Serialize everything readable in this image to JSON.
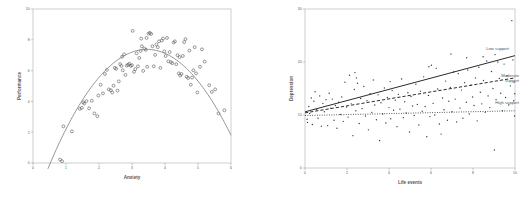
{
  "figure": {
    "panels": [
      "anxiety-performance",
      "life-events-depression"
    ]
  },
  "chart_data": [
    {
      "id": "anxiety-performance",
      "type": "scatter",
      "title": "",
      "xlabel": "Anxiety",
      "ylabel": "Performance",
      "xlim": [
        0,
        6
      ],
      "ylim": [
        0,
        10
      ],
      "xticks": [
        0,
        1,
        2,
        3,
        4,
        5,
        6
      ],
      "xtick_labels": [
        "0",
        "1",
        "2",
        "3",
        "4",
        "5",
        "6"
      ],
      "yticks": [
        0,
        2,
        4,
        6,
        8,
        10
      ],
      "ytick_labels": [
        "0",
        "2",
        "4",
        "6",
        "8",
        "10"
      ],
      "grid": false,
      "legend": "none",
      "marker": "open-circle",
      "fit": {
        "kind": "quadratic",
        "label": "quadratic fit curve",
        "style": "solid",
        "color": "#8a8a90",
        "peak_x": 3.45,
        "peak_y": 7.35,
        "coefficients": {
          "a": -0.86,
          "b": 5.94,
          "c": -2.88
        }
      },
      "points": [
        [
          0.82,
          0.22
        ],
        [
          0.88,
          0.12
        ],
        [
          0.92,
          2.38
        ],
        [
          1.18,
          2.05
        ],
        [
          1.42,
          3.52
        ],
        [
          1.48,
          3.58
        ],
        [
          1.52,
          3.95
        ],
        [
          1.55,
          3.86
        ],
        [
          1.62,
          4.02
        ],
        [
          1.7,
          3.55
        ],
        [
          1.78,
          4.04
        ],
        [
          1.86,
          3.22
        ],
        [
          1.95,
          3.04
        ],
        [
          1.98,
          4.38
        ],
        [
          2.05,
          5.08
        ],
        [
          2.12,
          4.52
        ],
        [
          2.18,
          5.78
        ],
        [
          2.24,
          6.05
        ],
        [
          2.3,
          4.78
        ],
        [
          2.36,
          4.72
        ],
        [
          2.4,
          4.58
        ],
        [
          2.44,
          5.02
        ],
        [
          2.48,
          6.18
        ],
        [
          2.52,
          6.12
        ],
        [
          2.56,
          4.7
        ],
        [
          2.6,
          5.3
        ],
        [
          2.64,
          6.42
        ],
        [
          2.68,
          6.3
        ],
        [
          2.72,
          6.02
        ],
        [
          2.76,
          7.05
        ],
        [
          2.8,
          5.72
        ],
        [
          2.84,
          6.32
        ],
        [
          2.88,
          6.38
        ],
        [
          2.92,
          6.45
        ],
        [
          2.96,
          6.3
        ],
        [
          3.0,
          6.35
        ],
        [
          3.02,
          8.58
        ],
        [
          3.06,
          5.92
        ],
        [
          3.1,
          6.1
        ],
        [
          3.14,
          7.12
        ],
        [
          3.18,
          6.28
        ],
        [
          3.22,
          6.82
        ],
        [
          3.26,
          7.28
        ],
        [
          3.3,
          7.58
        ],
        [
          3.34,
          5.98
        ],
        [
          3.38,
          7.42
        ],
        [
          3.42,
          7.35
        ],
        [
          3.46,
          6.25
        ],
        [
          3.5,
          8.4
        ],
        [
          3.54,
          8.45
        ],
        [
          3.58,
          8.38
        ],
        [
          3.62,
          7.58
        ],
        [
          3.66,
          6.28
        ],
        [
          3.7,
          7.02
        ],
        [
          3.74,
          7.7
        ],
        [
          3.78,
          7.52
        ],
        [
          3.82,
          7.9
        ],
        [
          3.86,
          6.18
        ],
        [
          3.9,
          7.95
        ],
        [
          3.94,
          8.08
        ],
        [
          3.98,
          7.25
        ],
        [
          4.02,
          6.95
        ],
        [
          4.06,
          8.12
        ],
        [
          4.1,
          6.6
        ],
        [
          4.14,
          7.2
        ],
        [
          4.18,
          6.55
        ],
        [
          4.22,
          6.48
        ],
        [
          4.26,
          7.82
        ],
        [
          4.3,
          7.9
        ],
        [
          4.34,
          6.42
        ],
        [
          4.38,
          7.0
        ],
        [
          4.42,
          5.82
        ],
        [
          4.46,
          5.68
        ],
        [
          4.5,
          5.78
        ],
        [
          4.54,
          6.95
        ],
        [
          4.58,
          7.85
        ],
        [
          4.62,
          8.05
        ],
        [
          4.66,
          5.6
        ],
        [
          4.7,
          5.52
        ],
        [
          4.74,
          7.3
        ],
        [
          4.78,
          5.08
        ],
        [
          4.82,
          5.55
        ],
        [
          4.86,
          6.02
        ],
        [
          4.9,
          7.52
        ],
        [
          4.94,
          5.82
        ],
        [
          4.98,
          4.58
        ],
        [
          5.06,
          6.25
        ],
        [
          5.12,
          7.38
        ],
        [
          5.2,
          6.58
        ],
        [
          5.34,
          5.05
        ],
        [
          5.42,
          4.62
        ],
        [
          5.52,
          4.78
        ],
        [
          5.62,
          3.22
        ],
        [
          5.8,
          3.42
        ],
        [
          3.28,
          8.08
        ],
        [
          3.44,
          8.12
        ],
        [
          2.7,
          6.9
        ],
        [
          4.44,
          6.88
        ]
      ]
    },
    {
      "id": "life-events-depression",
      "type": "scatter",
      "title": "",
      "xlabel": "Life events",
      "ylabel": "Depression",
      "xlim": [
        0,
        10
      ],
      "ylim": [
        0,
        30
      ],
      "xticks": [
        0,
        2,
        4,
        6,
        8,
        10
      ],
      "xtick_labels": [
        "0",
        "2",
        "4",
        "6",
        "8",
        "10"
      ],
      "yticks": [
        0,
        10,
        20,
        30
      ],
      "ytick_labels": [
        "0",
        "10",
        "20",
        "30"
      ],
      "grid": false,
      "legend": "inline-labels",
      "marker": "dot",
      "series": [
        {
          "name": "Low support",
          "label": "Low support",
          "style": "solid",
          "color": "#2a2a30",
          "intercept": 10.6,
          "slope": 1.06,
          "endpoints": [
            [
              0,
              10.6
            ],
            [
              10,
              21.2
            ]
          ]
        },
        {
          "name": "Moderate support",
          "label": "Moderate support",
          "style": "dashed",
          "color": "#2a2a30",
          "intercept": 10.4,
          "slope": 0.66,
          "endpoints": [
            [
              0,
              10.4
            ],
            [
              10,
              17.0
            ]
          ]
        },
        {
          "name": "High support",
          "label": "High support",
          "style": "dotted",
          "color": "#2a2a30",
          "intercept": 9.9,
          "slope": 0.09,
          "endpoints": [
            [
              0,
              9.9
            ],
            [
              10,
              10.8
            ]
          ]
        }
      ],
      "points": [
        [
          0.1,
          9.2
        ],
        [
          0.12,
          8.6
        ],
        [
          0.18,
          11.6
        ],
        [
          0.22,
          10.3
        ],
        [
          0.3,
          13.2
        ],
        [
          0.35,
          8.2
        ],
        [
          0.42,
          12.6
        ],
        [
          0.48,
          14.4
        ],
        [
          0.55,
          11.0
        ],
        [
          0.62,
          9.4
        ],
        [
          0.7,
          13.6
        ],
        [
          0.78,
          7.9
        ],
        [
          0.85,
          12.2
        ],
        [
          0.92,
          10.6
        ],
        [
          1.0,
          12.9
        ],
        [
          1.08,
          8.0
        ],
        [
          1.15,
          14.1
        ],
        [
          1.22,
          11.3
        ],
        [
          1.3,
          13.0
        ],
        [
          1.38,
          9.0
        ],
        [
          1.45,
          11.8
        ],
        [
          1.52,
          7.5
        ],
        [
          1.6,
          12.4
        ],
        [
          1.68,
          10.1
        ],
        [
          1.75,
          13.4
        ],
        [
          1.82,
          8.8
        ],
        [
          1.9,
          16.2
        ],
        [
          1.98,
          11.5
        ],
        [
          2.05,
          9.6
        ],
        [
          2.12,
          17.5
        ],
        [
          2.2,
          12.1
        ],
        [
          2.28,
          6.1
        ],
        [
          2.35,
          14.8
        ],
        [
          2.42,
          10.8
        ],
        [
          2.5,
          16.0
        ],
        [
          2.58,
          8.4
        ],
        [
          2.65,
          13.1
        ],
        [
          2.72,
          11.2
        ],
        [
          2.8,
          15.4
        ],
        [
          2.88,
          9.8
        ],
        [
          2.95,
          12.7
        ],
        [
          3.02,
          7.2
        ],
        [
          3.1,
          14.0
        ],
        [
          3.18,
          10.5
        ],
        [
          3.25,
          16.6
        ],
        [
          3.32,
          11.9
        ],
        [
          3.4,
          9.1
        ],
        [
          3.48,
          13.8
        ],
        [
          3.55,
          5.2
        ],
        [
          3.62,
          12.3
        ],
        [
          3.7,
          10.2
        ],
        [
          3.78,
          15.1
        ],
        [
          3.85,
          8.5
        ],
        [
          3.92,
          13.3
        ],
        [
          4.0,
          11.4
        ],
        [
          4.08,
          9.3
        ],
        [
          4.15,
          14.6
        ],
        [
          4.22,
          10.9
        ],
        [
          4.3,
          12.8
        ],
        [
          4.38,
          7.8
        ],
        [
          4.45,
          13.9
        ],
        [
          4.52,
          11.1
        ],
        [
          4.6,
          16.8
        ],
        [
          4.68,
          9.5
        ],
        [
          4.75,
          12.5
        ],
        [
          4.82,
          10.4
        ],
        [
          4.9,
          14.2
        ],
        [
          4.98,
          6.8
        ],
        [
          5.05,
          13.5
        ],
        [
          5.12,
          11.7
        ],
        [
          5.2,
          9.9
        ],
        [
          5.28,
          15.8
        ],
        [
          5.35,
          12.0
        ],
        [
          5.42,
          8.1
        ],
        [
          5.5,
          14.5
        ],
        [
          5.58,
          10.7
        ],
        [
          5.65,
          17.2
        ],
        [
          5.72,
          11.6
        ],
        [
          5.8,
          5.9
        ],
        [
          5.88,
          13.7
        ],
        [
          5.95,
          9.7
        ],
        [
          6.02,
          19.4
        ],
        [
          6.1,
          12.2
        ],
        [
          6.18,
          10.0
        ],
        [
          6.25,
          18.8
        ],
        [
          6.32,
          14.9
        ],
        [
          6.4,
          8.3
        ],
        [
          6.48,
          6.4
        ],
        [
          6.55,
          13.2
        ],
        [
          6.62,
          11.0
        ],
        [
          6.7,
          16.4
        ],
        [
          6.78,
          9.0
        ],
        [
          6.85,
          12.6
        ],
        [
          6.92,
          15.2
        ],
        [
          7.0,
          10.6
        ],
        [
          7.08,
          18.1
        ],
        [
          7.15,
          13.0
        ],
        [
          7.22,
          8.7
        ],
        [
          7.3,
          17.8
        ],
        [
          7.38,
          11.3
        ],
        [
          7.45,
          14.7
        ],
        [
          7.52,
          9.4
        ],
        [
          7.6,
          16.1
        ],
        [
          7.68,
          12.4
        ],
        [
          7.75,
          18.5
        ],
        [
          7.82,
          10.2
        ],
        [
          7.9,
          15.6
        ],
        [
          7.98,
          13.4
        ],
        [
          8.05,
          11.8
        ],
        [
          8.12,
          17.0
        ],
        [
          8.2,
          8.9
        ],
        [
          8.28,
          19.0
        ],
        [
          8.35,
          14.3
        ],
        [
          8.42,
          12.1
        ],
        [
          8.5,
          16.5
        ],
        [
          8.58,
          10.5
        ],
        [
          8.65,
          20.2
        ],
        [
          8.72,
          13.6
        ],
        [
          8.8,
          11.4
        ],
        [
          8.88,
          18.2
        ],
        [
          8.95,
          15.0
        ],
        [
          9.02,
          3.4
        ],
        [
          9.1,
          12.9
        ],
        [
          9.18,
          20.0
        ],
        [
          9.25,
          16.9
        ],
        [
          9.32,
          14.1
        ],
        [
          9.4,
          10.8
        ],
        [
          9.48,
          19.6
        ],
        [
          9.55,
          13.3
        ],
        [
          9.62,
          17.4
        ],
        [
          9.7,
          11.9
        ],
        [
          9.78,
          15.5
        ],
        [
          9.85,
          27.8
        ],
        [
          9.9,
          20.4
        ],
        [
          9.94,
          12.7
        ],
        [
          9.96,
          16.2
        ],
        [
          9.98,
          9.8
        ],
        [
          9.99,
          14.0
        ],
        [
          2.38,
          18.0
        ],
        [
          2.45,
          17.0
        ],
        [
          4.05,
          16.3
        ],
        [
          5.9,
          19.1
        ],
        [
          6.95,
          21.5
        ],
        [
          7.7,
          20.8
        ],
        [
          8.48,
          21.0
        ],
        [
          9.05,
          21.4
        ]
      ]
    }
  ]
}
